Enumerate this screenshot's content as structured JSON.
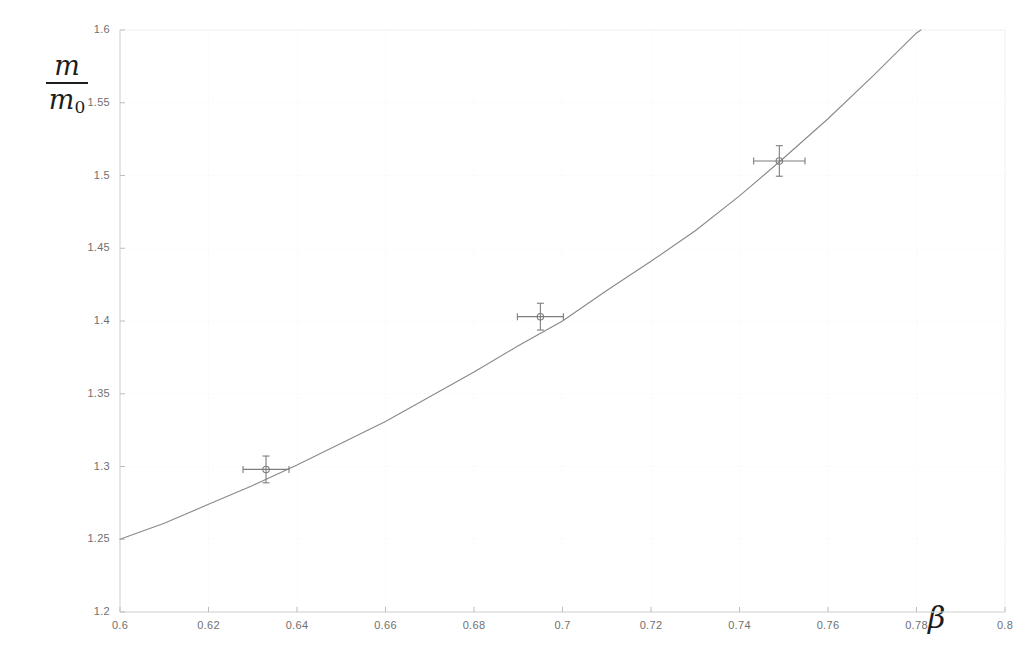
{
  "chart_data": {
    "type": "line",
    "title": "",
    "subtitle": "",
    "xlabel": "β",
    "ylabel": "m/m₀",
    "xlim": [
      0.6,
      0.8
    ],
    "ylim": [
      1.2,
      1.6
    ],
    "grid": true,
    "grid_style": "faint dotted",
    "legend": "none",
    "background_color": "#ffffff",
    "curve_color": "#8a8a8a",
    "marker_color": "#7d7d7d",
    "axis_color": "#c8c8c8",
    "x_ticks": [
      "0.6",
      "0.62",
      "0.64",
      "0.66",
      "0.68",
      "0.7",
      "0.72",
      "0.74",
      "0.76",
      "0.78",
      "0.8"
    ],
    "x_tick_values": [
      0.6,
      0.62,
      0.64,
      0.66,
      0.68,
      0.7,
      0.72,
      0.74,
      0.76,
      0.78,
      0.8
    ],
    "y_ticks": [
      "1.2",
      "1.25",
      "1.3",
      "1.35",
      "1.4",
      "1.45",
      "1.5",
      "1.55",
      "1.6"
    ],
    "y_tick_values": [
      1.2,
      1.25,
      1.3,
      1.35,
      1.4,
      1.45,
      1.5,
      1.55,
      1.6
    ],
    "series": [
      {
        "name": "theory-curve",
        "kind": "line",
        "formula": "1/sqrt(1-beta^2)",
        "x": [
          0.6,
          0.61,
          0.62,
          0.63,
          0.64,
          0.65,
          0.66,
          0.67,
          0.68,
          0.69,
          0.7,
          0.71,
          0.72,
          0.73,
          0.74,
          0.75,
          0.76,
          0.77,
          0.78,
          0.781
        ],
        "y": [
          1.25,
          1.261,
          1.274,
          1.287,
          1.301,
          1.316,
          1.331,
          1.348,
          1.365,
          1.383,
          1.4,
          1.421,
          1.441,
          1.462,
          1.486,
          1.512,
          1.539,
          1.568,
          1.598,
          1.6
        ]
      },
      {
        "name": "measured-points",
        "kind": "scatter-with-errorbars",
        "points": [
          {
            "x": 0.633,
            "y": 1.298,
            "xerr": 0.0052,
            "yerr": 0.0092
          },
          {
            "x": 0.695,
            "y": 1.403,
            "xerr": 0.0052,
            "yerr": 0.0092
          },
          {
            "x": 0.749,
            "y": 1.51,
            "xerr": 0.0058,
            "yerr": 0.0105
          }
        ]
      }
    ]
  },
  "plot_geometry": {
    "left": 120,
    "right": 1005,
    "top": 30,
    "bottom": 612
  }
}
